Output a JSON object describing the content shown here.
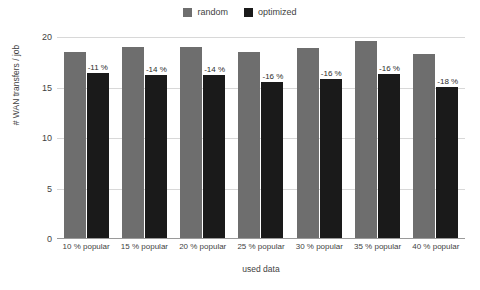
{
  "chart_data": {
    "type": "bar",
    "title": "",
    "xlabel": "used data",
    "ylabel": "# WAN transfers / job",
    "categories": [
      "10 % popular",
      "15 % popular",
      "20 % popular",
      "25 % popular",
      "30 % popular",
      "35 % popular",
      "40 % popular"
    ],
    "series": [
      {
        "name": "random",
        "color": "#6e6e6e",
        "values": [
          18.5,
          19.0,
          19.0,
          18.5,
          18.9,
          19.6,
          18.3
        ]
      },
      {
        "name": "optimized",
        "color": "#1a1a1a",
        "values": [
          16.4,
          16.2,
          16.2,
          15.5,
          15.8,
          16.3,
          15.1
        ]
      }
    ],
    "annotations": [
      "-11 %",
      "-14 %",
      "-14 %",
      "-16 %",
      "-16 %",
      "-16 %",
      "-18 %"
    ],
    "ylim": [
      0,
      20
    ],
    "yticks": [
      0,
      5,
      10,
      15,
      20
    ],
    "ytick_labels": [
      "0",
      "5",
      "10",
      "15",
      "20"
    ],
    "grid": true,
    "legend_position": "top-center",
    "background_color": "#ffffff",
    "gridline_color": "#d8d8d8",
    "axis_color": "#9a9a9a"
  }
}
